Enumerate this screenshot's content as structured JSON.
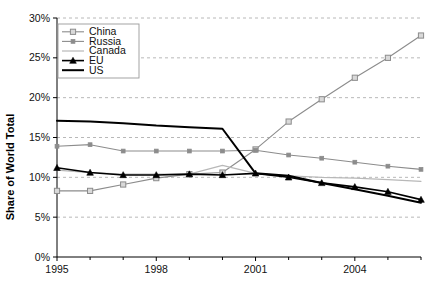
{
  "chart_data": {
    "type": "line",
    "title": "",
    "subtitle": "",
    "xlabel": "",
    "ylabel": "Share of World Total",
    "x": [
      1995,
      1996,
      1997,
      1998,
      1999,
      2000,
      2001,
      2002,
      2003,
      2004,
      2005,
      2006
    ],
    "xlim": [
      1995,
      2006
    ],
    "ylim": [
      0,
      30
    ],
    "x_tick_labels": [
      "1995",
      "1998",
      "2001",
      "2004"
    ],
    "x_tick_values": [
      1995,
      1998,
      2001,
      2004
    ],
    "x_minor_ticks": [
      1996,
      1997,
      1999,
      2000,
      2002,
      2003,
      2005,
      2006
    ],
    "y_tick_labels": [
      "0%",
      "5%",
      "10%",
      "15%",
      "20%",
      "25%",
      "30%"
    ],
    "y_tick_values": [
      0,
      5,
      10,
      15,
      20,
      25,
      30
    ],
    "grid": true,
    "grid_axis": "y",
    "grid_style": "dashed",
    "grid_color": "#b0b0b0",
    "legend_position": "top-left",
    "series": [
      {
        "name": "China",
        "color": "#8c8c8c",
        "marker": "open-square",
        "line_width": 1.1,
        "values": [
          8.3,
          8.3,
          9.1,
          9.9,
          10.4,
          10.6,
          13.5,
          17.0,
          19.8,
          22.5,
          25.0,
          27.8
        ]
      },
      {
        "name": "Russia",
        "color": "#8c8c8c",
        "marker": "filled-dot",
        "line_width": 1.1,
        "values": [
          13.9,
          14.1,
          13.3,
          13.3,
          13.3,
          13.3,
          13.4,
          12.8,
          12.4,
          11.9,
          11.4,
          11.0
        ]
      },
      {
        "name": "Canada",
        "color": "#b8b8b8",
        "marker": "none",
        "line_width": 1.2,
        "values": [
          10.9,
          10.6,
          10.4,
          10.4,
          10.4,
          11.5,
          10.5,
          10.2,
          10.0,
          9.9,
          9.7,
          9.5
        ]
      },
      {
        "name": "EU",
        "color": "#000000",
        "marker": "filled-triangle",
        "line_width": 1.6,
        "values": [
          11.2,
          10.6,
          10.3,
          10.3,
          10.4,
          10.3,
          10.5,
          10.0,
          9.3,
          8.8,
          8.2,
          7.2
        ]
      },
      {
        "name": "US",
        "color": "#000000",
        "marker": "none",
        "line_width": 2.0,
        "values": [
          17.1,
          17.0,
          16.8,
          16.5,
          16.3,
          16.1,
          10.5,
          10.2,
          9.3,
          8.5,
          7.7,
          6.8
        ]
      }
    ]
  },
  "axes": {
    "y_axis_label": "Share of World Total",
    "axis_color": "#000000",
    "background": "#ffffff"
  },
  "legend": {
    "entries": [
      {
        "label": "China"
      },
      {
        "label": "Russia"
      },
      {
        "label": "Canada"
      },
      {
        "label": "EU"
      },
      {
        "label": "US"
      }
    ],
    "border_color": "#9a9a9a",
    "background": "#ffffff"
  }
}
